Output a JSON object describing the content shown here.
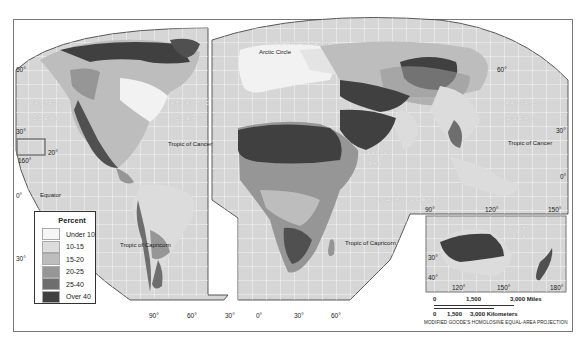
{
  "map": {
    "title": "",
    "projection_note": "MODIFIED GOODE'S HOMOLOSINE EQUAL-AREA PROJECTION",
    "legend": {
      "title": "Percent",
      "items": [
        {
          "label": "Under 10",
          "color": "#f6f6f6"
        },
        {
          "label": "10-15",
          "color": "#dcdcdc"
        },
        {
          "label": "15-20",
          "color": "#bdbdbd"
        },
        {
          "label": "20-25",
          "color": "#969696"
        },
        {
          "label": "25-40",
          "color": "#6e6e6e"
        },
        {
          "label": "Over 40",
          "color": "#404040"
        }
      ]
    },
    "labels": {
      "arctic_ocean": "ARCTIC OCEAN",
      "arctic_circle": "Arctic Circle",
      "pacific_left_1": "PACIFIC",
      "pacific_left_2": "OCEAN",
      "atlantic_1": "ATLANTIC",
      "atlantic_2": "OCEAN",
      "pacific_right_1": "PACIFIC",
      "pacific_right_2": "OCEAN",
      "indian_ocean": "INDIAN   OCEAN",
      "arabian_sea_1": "Arabian",
      "arabian_sea_2": "Sea",
      "coral_sea_1": "Coral",
      "coral_sea_2": "Sea",
      "tropic_cancer_left": "Tropic of Cancer",
      "tropic_cancer_right": "Tropic of Cancer",
      "equator": "Equator",
      "tropic_capricorn_left": "Tropic of Capricorn",
      "tropic_capricorn_right": "Tropic of Capricorn"
    },
    "degrees": {
      "lat60_left": "60°",
      "lat30_left": "30°",
      "lat20_inset": "20°",
      "lon160_inset": "160°",
      "lat0_left": "0°",
      "lat30s_left": "30°",
      "lon90_sa": "90°",
      "lon60_sa": "60°",
      "lon30_sa": "30°",
      "lon0_af": "0°",
      "lon30_af": "30°",
      "lon60_af": "60°",
      "lat60_right": "60°",
      "lat30_right": "30°",
      "lat0_right": "0°",
      "lon90_asia": "90°",
      "lon120_asia": "120°",
      "lon150_asia": "150°",
      "lat30_aus": "30°",
      "lat40_aus": "40°",
      "lon120_aus": "120°",
      "lon150_aus": "150°",
      "lon180_aus": "180°"
    },
    "scale": {
      "miles_0": "0",
      "miles_1500": "1,500",
      "miles_3000": "3,000 Miles",
      "km_0": "0",
      "km_1500": "1,500",
      "km_3000": "3,000 Kilometers"
    }
  }
}
